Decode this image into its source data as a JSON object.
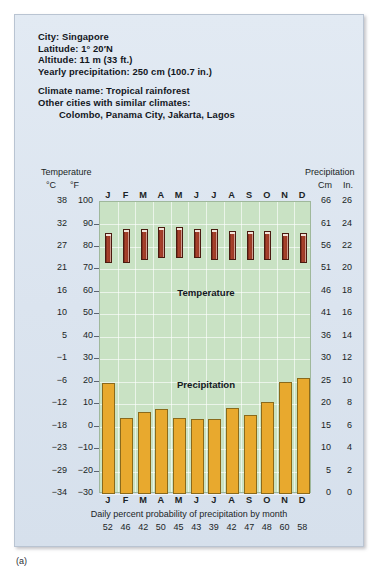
{
  "figure_label": "(a)",
  "info": {
    "city_line": "City: Singapore",
    "latitude_line": "Latitude: 1° 20′N",
    "altitude_line": "Altitude: 11 m (33 ft.)",
    "precip_line": "Yearly precipitation: 250 cm (100.7 in.)",
    "climate_line": "Climate name: Tropical rainforest",
    "similar_label": "Other cities with similar climates:",
    "similar_cities": "Colombo, Panama City, Jakarta, Lagos"
  },
  "scales": {
    "temperature_title": "Temperature",
    "precipitation_title": "Precipitation",
    "celsius_unit": "°C",
    "fahrenheit_unit": "°F",
    "cm_unit": "Cm",
    "inch_unit": "In."
  },
  "captions": {
    "probability_caption": "Daily percent probability of precipitation by month"
  },
  "chart_data": {
    "type": "bar",
    "categories": [
      "J",
      "F",
      "M",
      "A",
      "M",
      "J",
      "J",
      "A",
      "S",
      "O",
      "N",
      "D"
    ],
    "month_names": [
      "January",
      "February",
      "March",
      "April",
      "May",
      "June",
      "July",
      "August",
      "September",
      "October",
      "November",
      "December"
    ],
    "grid": true,
    "legend_position": "inside-plot",
    "plot_background": "#c9e2c4",
    "annotations": [
      "Temperature",
      "Precipitation"
    ],
    "axes": {
      "left": {
        "label": "Temperature",
        "units": [
          "°C",
          "°F"
        ],
        "fahrenheit_ticks": [
          100,
          90,
          80,
          70,
          60,
          50,
          40,
          30,
          20,
          10,
          0,
          -10,
          -20,
          -30
        ],
        "celsius_ticks": [
          38,
          32,
          27,
          21,
          16,
          10,
          5,
          -1,
          -6,
          -12,
          -18,
          -23,
          -29,
          -34
        ],
        "flim_f": [
          -30,
          100
        ]
      },
      "right": {
        "label": "Precipitation",
        "units": [
          "Cm",
          "In."
        ],
        "inch_ticks": [
          26,
          24,
          22,
          20,
          18,
          16,
          14,
          12,
          10,
          8,
          6,
          4,
          2,
          0
        ],
        "cm_ticks": [
          66,
          61,
          56,
          51,
          46,
          41,
          36,
          30,
          25,
          20,
          15,
          10,
          5,
          0
        ],
        "ylim_in": [
          0,
          26
        ]
      }
    },
    "series": [
      {
        "name": "Temperature range",
        "type": "range-bar",
        "units": "°F",
        "color": "#9c3a26",
        "low_f": [
          73,
          73,
          74,
          75,
          75,
          75,
          74,
          74,
          74,
          74,
          74,
          73
        ],
        "high_f": [
          86,
          88,
          88,
          89,
          89,
          88,
          88,
          87,
          87,
          87,
          86,
          86
        ]
      },
      {
        "name": "Precipitation",
        "type": "bar",
        "units": "in.",
        "color": "#e9a92c",
        "values_in": [
          9.9,
          6.8,
          7.3,
          7.6,
          6.8,
          6.7,
          6.7,
          7.7,
          7.0,
          8.2,
          10.0,
          10.3
        ],
        "values_cm": [
          25.1,
          17.3,
          18.5,
          19.3,
          17.3,
          17.0,
          17.0,
          19.6,
          17.8,
          20.8,
          25.4,
          26.2
        ]
      }
    ],
    "probability_row": {
      "label": "Daily percent probability of precipitation by month",
      "values": [
        52,
        46,
        42,
        50,
        45,
        43,
        39,
        42,
        47,
        48,
        60,
        58
      ]
    }
  }
}
